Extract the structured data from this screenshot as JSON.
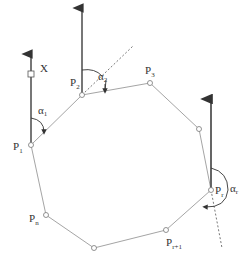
{
  "colors": {
    "polygon_edge": "#9a9a9a",
    "vector": "#555555",
    "text": "#333333",
    "vertex_fill": "#ffffff"
  },
  "labels": {
    "x_axis": "X",
    "p1": {
      "base": "P",
      "sub": "1"
    },
    "p2": {
      "base": "P",
      "sub": "2"
    },
    "p3": {
      "base": "P",
      "sub": "3"
    },
    "pr": {
      "base": "P",
      "sub": "r"
    },
    "pr1": {
      "base": "P",
      "sub": "r+1"
    },
    "pn": {
      "base": "P",
      "sub": "n"
    },
    "alpha1": {
      "base": "α",
      "sub": "1"
    },
    "alpha2": {
      "base": "α",
      "sub": "2"
    },
    "alphar": {
      "base": "α",
      "sub": "r"
    }
  }
}
